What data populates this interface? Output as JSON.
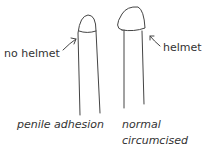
{
  "figures": [
    {
      "id": "left",
      "pointer_label": "no helmet",
      "caption": "penile adhesion"
    },
    {
      "id": "right",
      "pointer_label": "helmet",
      "caption_line1": "normal circumcised",
      "caption_line2": "penis"
    }
  ],
  "colors": {
    "stroke": "#444444",
    "text": "#333333"
  }
}
